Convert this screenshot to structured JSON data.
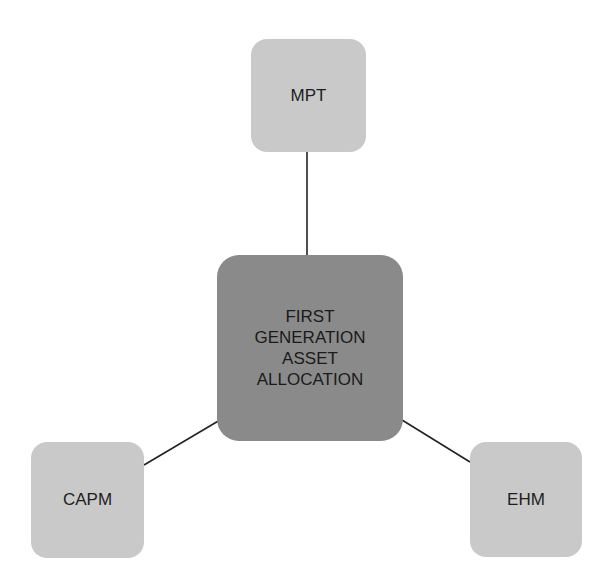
{
  "diagram": {
    "center": {
      "label": "FIRST\nGENERATION\nASSET\nALLOCATION"
    },
    "nodes": [
      {
        "id": "mpt",
        "label": "MPT"
      },
      {
        "id": "capm",
        "label": "CAPM"
      },
      {
        "id": "ehm",
        "label": "EHM"
      }
    ],
    "edges": [
      {
        "from": "center",
        "to": "mpt"
      },
      {
        "from": "center",
        "to": "capm"
      },
      {
        "from": "center",
        "to": "ehm"
      }
    ],
    "colors": {
      "center_fill": "#8a8a8a",
      "node_fill": "#c9c9c9",
      "edge": "#222222"
    }
  }
}
